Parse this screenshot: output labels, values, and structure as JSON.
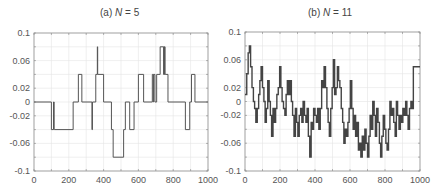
{
  "chart_data": [
    {
      "type": "line",
      "title": "(a) N = 5",
      "title_prefix": "(a) ",
      "title_var": "N",
      "title_suffix": " = 5",
      "xlabel": "",
      "ylabel": "",
      "xlim": [
        0,
        1000
      ],
      "ylim": [
        -0.1,
        0.1
      ],
      "xticks": [
        0,
        200,
        400,
        600,
        800,
        1000
      ],
      "yticks": [
        0.1,
        0.06,
        0.02,
        0,
        -0.02,
        -0.06,
        -0.1
      ],
      "ytick_labels": [
        "0.1",
        "0.06",
        "0.02",
        "0",
        "-0.02",
        "-0.06",
        "-0.1"
      ],
      "grid": true,
      "line_color": "#555555",
      "step": true,
      "x": [
        0,
        100,
        112,
        116,
        120,
        225,
        255,
        275,
        333,
        336,
        338,
        355,
        364,
        366,
        368,
        400,
        445,
        455,
        515,
        525,
        550,
        575,
        600,
        630,
        680,
        686,
        688,
        695,
        705,
        725,
        745,
        747,
        749,
        751,
        753,
        755,
        770,
        870,
        895,
        905,
        925,
        1000
      ],
      "y": [
        0,
        -0.04,
        0,
        -0.04,
        -0.04,
        0,
        0.04,
        0,
        -0.04,
        0,
        0,
        0.04,
        0.08,
        0.04,
        0.04,
        0,
        -0.04,
        -0.08,
        -0.04,
        0,
        -0.04,
        0,
        0.04,
        0,
        0.04,
        0,
        0.04,
        0,
        0.04,
        0.08,
        0.04,
        0.08,
        0.04,
        0.08,
        0.04,
        0.04,
        0,
        -0.04,
        0,
        0.04,
        0,
        0
      ]
    },
    {
      "type": "line",
      "title": "(b) N = 11",
      "title_prefix": "(b) ",
      "title_var": "N",
      "title_suffix": " = 11",
      "xlabel": "",
      "ylabel": "",
      "xlim": [
        0,
        1000
      ],
      "ylim": [
        -0.1,
        0.1
      ],
      "xticks": [
        0,
        200,
        400,
        600,
        800,
        1000
      ],
      "yticks": [
        0.1,
        0.06,
        0.02,
        0,
        -0.02,
        -0.06,
        -0.1
      ],
      "ytick_labels": [
        "0.1",
        "0.06",
        "0.02",
        "0",
        "-0.02",
        "-0.06",
        "-0.1"
      ],
      "grid": true,
      "line_color": "#444444",
      "step": true,
      "x": [
        0,
        10,
        18,
        25,
        32,
        40,
        48,
        55,
        62,
        70,
        78,
        85,
        92,
        100,
        108,
        115,
        122,
        130,
        138,
        145,
        152,
        160,
        168,
        175,
        182,
        190,
        198,
        205,
        212,
        220,
        228,
        235,
        242,
        250,
        258,
        265,
        272,
        280,
        288,
        295,
        302,
        310,
        318,
        325,
        332,
        340,
        348,
        355,
        362,
        370,
        378,
        385,
        392,
        400,
        408,
        415,
        422,
        430,
        438,
        445,
        452,
        460,
        468,
        475,
        482,
        490,
        498,
        505,
        512,
        520,
        528,
        535,
        542,
        550,
        558,
        565,
        572,
        580,
        588,
        595,
        602,
        610,
        618,
        625,
        632,
        640,
        648,
        655,
        662,
        670,
        678,
        685,
        692,
        700,
        708,
        715,
        722,
        730,
        738,
        745,
        752,
        760,
        768,
        775,
        782,
        790,
        798,
        805,
        812,
        820,
        828,
        835,
        842,
        850,
        858,
        865,
        872,
        880,
        888,
        895,
        902,
        910,
        918,
        925,
        932,
        940,
        948,
        955,
        962,
        970,
        978,
        985,
        992,
        1000
      ],
      "y": [
        0.01,
        0.04,
        0.07,
        0.08,
        0.05,
        0.02,
        0.0,
        -0.01,
        -0.03,
        -0.01,
        0.01,
        0.03,
        0.05,
        0.02,
        0.0,
        -0.03,
        -0.01,
        0.03,
        0.0,
        -0.02,
        -0.05,
        -0.01,
        -0.03,
        -0.01,
        0.01,
        0.02,
        0.05,
        0.02,
        0.0,
        -0.01,
        -0.02,
        0.01,
        0.03,
        0.01,
        0.03,
        0.0,
        -0.02,
        -0.05,
        -0.01,
        -0.03,
        -0.05,
        -0.02,
        -0.01,
        -0.03,
        0.0,
        -0.02,
        -0.03,
        -0.01,
        -0.05,
        -0.08,
        -0.03,
        -0.04,
        -0.01,
        -0.02,
        -0.03,
        -0.01,
        -0.04,
        -0.01,
        0.03,
        0.02,
        0.05,
        0.02,
        -0.01,
        -0.03,
        -0.05,
        -0.01,
        0.02,
        0.06,
        0.01,
        0.02,
        0.05,
        0.03,
        0.02,
        -0.01,
        -0.03,
        -0.06,
        -0.04,
        -0.05,
        -0.03,
        -0.01,
        0.03,
        -0.01,
        -0.04,
        -0.02,
        -0.05,
        -0.03,
        -0.07,
        -0.06,
        -0.08,
        -0.05,
        -0.07,
        -0.04,
        -0.06,
        -0.08,
        -0.05,
        -0.02,
        -0.04,
        0.0,
        -0.02,
        -0.05,
        -0.01,
        -0.03,
        -0.06,
        -0.08,
        -0.05,
        -0.02,
        -0.04,
        -0.06,
        -0.07,
        -0.04,
        0.0,
        -0.02,
        -0.01,
        -0.03,
        -0.05,
        0.0,
        -0.02,
        -0.04,
        -0.02,
        -0.03,
        -0.01,
        -0.02,
        0.0,
        -0.02,
        -0.04,
        -0.01,
        0.0,
        -0.01,
        0.05,
        0.05,
        0.05,
        0.05,
        0.05,
        0.05
      ]
    }
  ],
  "panels": [
    {
      "title_prefix": "(a) ",
      "title_var": "N",
      "title_suffix": " = 5"
    },
    {
      "title_prefix": "(b) ",
      "title_var": "N",
      "title_suffix": " = 11"
    }
  ]
}
